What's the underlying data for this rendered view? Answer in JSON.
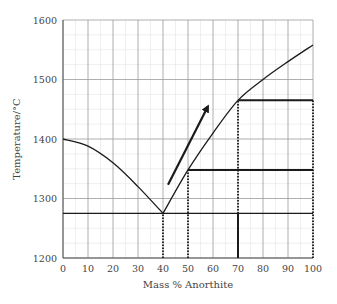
{
  "chart_data": {
    "type": "line",
    "title": "",
    "xlabel": "Mass % Anorthite",
    "ylabel": "Temperature/°C",
    "xlim": [
      0,
      100
    ],
    "ylim": [
      1200,
      1600
    ],
    "x_ticks": [
      0,
      10,
      20,
      30,
      40,
      50,
      60,
      70,
      80,
      90,
      100
    ],
    "y_ticks": [
      1200,
      1300,
      1400,
      1500,
      1600
    ],
    "grid": true,
    "legend": "none",
    "series": [
      {
        "name": "liquidus-albite-side",
        "x": [
          0,
          10,
          20,
          30,
          40
        ],
        "y": [
          1400,
          1388,
          1360,
          1320,
          1275
        ]
      },
      {
        "name": "liquidus-anorthite-side",
        "x": [
          40,
          50,
          60,
          70,
          80,
          90,
          100
        ],
        "y": [
          1275,
          1348,
          1410,
          1465,
          1500,
          1530,
          1558
        ]
      }
    ],
    "horizontal_lines": [
      {
        "name": "eutectic",
        "y": 1275,
        "x_from": 0,
        "x_to": 100
      },
      {
        "name": "line-1348",
        "y": 1348,
        "x_from": 50,
        "x_to": 100
      },
      {
        "name": "line-1465",
        "y": 1465,
        "x_from": 70,
        "x_to": 100
      }
    ],
    "vertical_dotted_lines": [
      {
        "x": 40,
        "y_from": 1200,
        "y_to": 1275
      },
      {
        "x": 50,
        "y_from": 1200,
        "y_to": 1348
      },
      {
        "x": 70,
        "y_from": 1275,
        "y_to": 1465
      },
      {
        "x": 100,
        "y_from": 1200,
        "y_to": 1465
      }
    ],
    "vertical_solid_lines": [
      {
        "x": 70,
        "y_from": 1200,
        "y_to": 1275
      }
    ],
    "annotations": [
      {
        "type": "arrow",
        "from": [
          42,
          1323
        ],
        "to": [
          58,
          1455
        ]
      }
    ]
  }
}
